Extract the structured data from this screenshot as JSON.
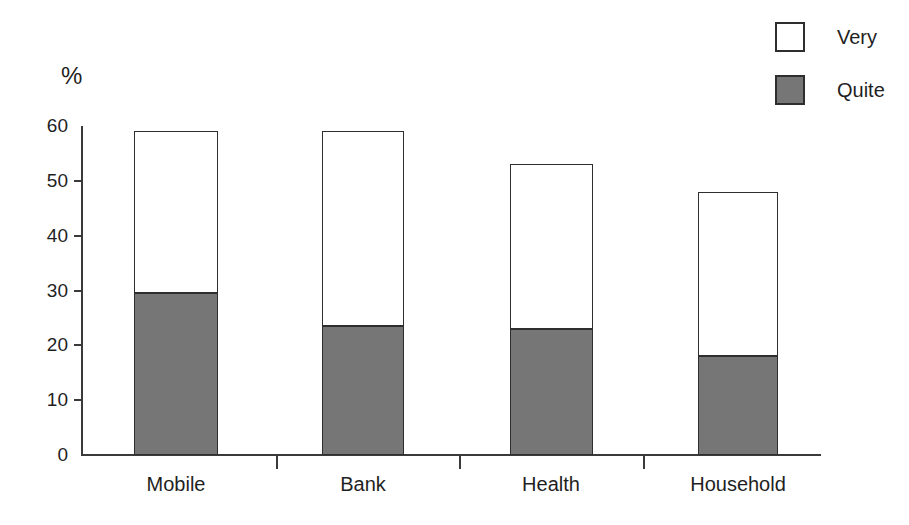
{
  "chart_data": {
    "type": "bar",
    "subtype": "stacked-vertical",
    "title": "",
    "xlabel": "",
    "ylabel": "%",
    "ylim": [
      0,
      60
    ],
    "ytick_values": [
      0,
      10,
      20,
      30,
      40,
      50,
      60
    ],
    "ytick_labels": [
      "0",
      "10",
      "20",
      "30",
      "40",
      "50",
      "60"
    ],
    "grid": false,
    "legend_position": "top-right",
    "categories": [
      "Mobile",
      "Bank",
      "Health",
      "Household"
    ],
    "series": [
      {
        "name": "Very",
        "values": [
          29.5,
          35.5,
          30,
          30
        ],
        "color": "#ffffff",
        "swatch": "white-outlined-square"
      },
      {
        "name": "Quite",
        "values": [
          29.5,
          23.5,
          23,
          18
        ],
        "color": "#767676",
        "swatch": "gray-filled-square"
      }
    ],
    "stack_totals": [
      59,
      59,
      53,
      48
    ],
    "annotations": []
  },
  "axes": {
    "unit_label": "%",
    "ytick_labels": [
      "60",
      "50",
      "40",
      "30",
      "20",
      "10",
      "0"
    ]
  },
  "legend": {
    "items": [
      {
        "label": "Very",
        "swatch_color": "#ffffff",
        "swatch_border": "#2e2e2e"
      },
      {
        "label": "Quite",
        "swatch_color": "#767676",
        "swatch_border": "#2e2e2e"
      }
    ]
  },
  "colors": {
    "ink": "#1f1f1f",
    "axis": "#3a3a3a",
    "bar_outline": "#2e2e2e",
    "quite_fill": "#767676",
    "very_fill": "#ffffff",
    "background": "#ffffff"
  }
}
